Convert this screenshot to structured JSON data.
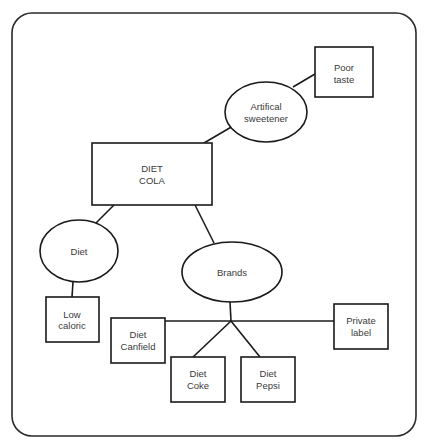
{
  "diagram": {
    "type": "concept-map",
    "root": "DIET COLA",
    "nodes": [
      {
        "id": "diet_cola",
        "shape": "rectangle",
        "lines": [
          "DIET",
          "COLA"
        ]
      },
      {
        "id": "artificial_sweetener",
        "shape": "ellipse",
        "lines": [
          "Artifical",
          "sweetener"
        ]
      },
      {
        "id": "poor_taste",
        "shape": "rectangle",
        "lines": [
          "Poor",
          "taste"
        ]
      },
      {
        "id": "diet",
        "shape": "ellipse",
        "lines": [
          "Diet"
        ]
      },
      {
        "id": "low_caloric",
        "shape": "rectangle",
        "lines": [
          "Low",
          "caloric"
        ]
      },
      {
        "id": "brands",
        "shape": "ellipse",
        "lines": [
          "Brands"
        ]
      },
      {
        "id": "diet_canfield",
        "shape": "rectangle",
        "lines": [
          "Diet",
          "Canfield"
        ]
      },
      {
        "id": "diet_coke",
        "shape": "rectangle",
        "lines": [
          "Diet",
          "Coke"
        ]
      },
      {
        "id": "diet_pepsi",
        "shape": "rectangle",
        "lines": [
          "Diet",
          "Pepsi"
        ]
      },
      {
        "id": "private_label",
        "shape": "rectangle",
        "lines": [
          "Private",
          "label"
        ]
      }
    ],
    "edges": [
      [
        "diet_cola",
        "artificial_sweetener"
      ],
      [
        "artificial_sweetener",
        "poor_taste"
      ],
      [
        "diet_cola",
        "diet"
      ],
      [
        "diet",
        "low_caloric"
      ],
      [
        "diet_cola",
        "brands"
      ],
      [
        "brands",
        "diet_canfield"
      ],
      [
        "brands",
        "diet_coke"
      ],
      [
        "brands",
        "diet_pepsi"
      ],
      [
        "brands",
        "private_label"
      ]
    ]
  },
  "colors": {
    "stroke": "#1a1a1a",
    "text": "#3a3a3a",
    "background": "#ffffff"
  }
}
